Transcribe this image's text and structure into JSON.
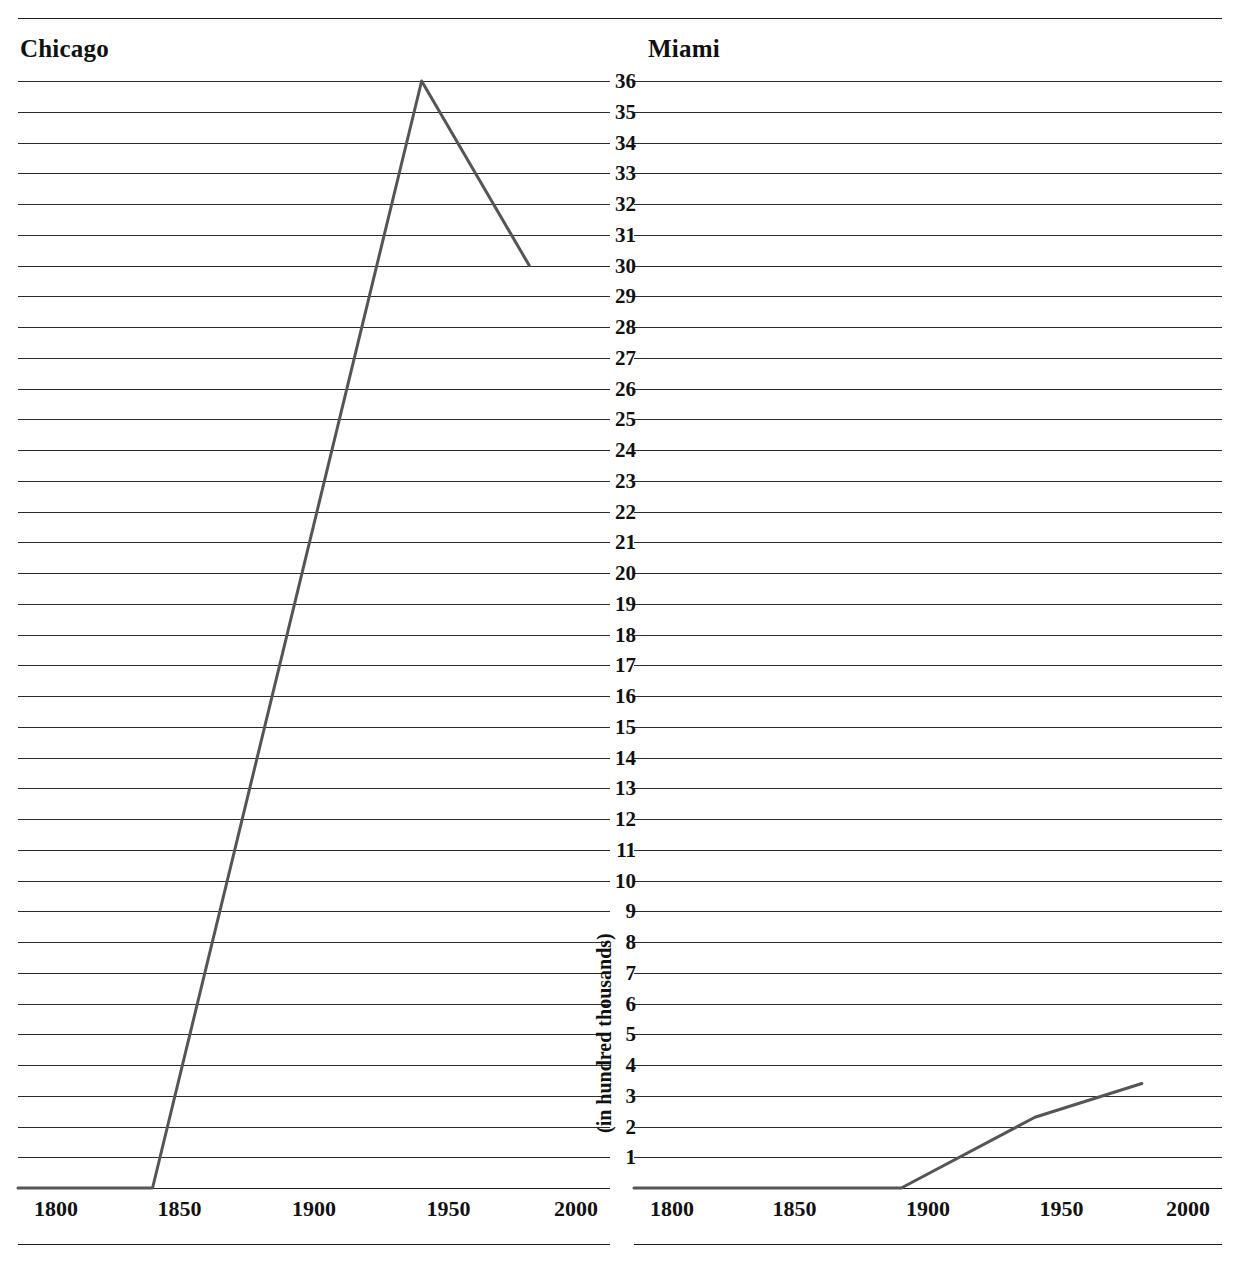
{
  "figure": {
    "yaxis_caption": "(in hundred thousands)"
  },
  "panels": [
    {
      "key": "chicago",
      "title": "Chicago"
    },
    {
      "key": "miami",
      "title": "Miami"
    }
  ],
  "axis": {
    "y_ticks": [
      36,
      35,
      34,
      33,
      32,
      31,
      30,
      29,
      28,
      27,
      26,
      25,
      24,
      23,
      22,
      21,
      20,
      19,
      18,
      17,
      16,
      15,
      14,
      13,
      12,
      11,
      10,
      9,
      8,
      7,
      6,
      5,
      4,
      3,
      2,
      1
    ],
    "x_ticks": [
      1800,
      1850,
      1900,
      1950,
      2000
    ]
  },
  "chart_data": [
    {
      "type": "line",
      "title": "Chicago",
      "xlabel": "",
      "ylabel": "(in hundred thousands)",
      "xlim": [
        1790,
        2010
      ],
      "ylim": [
        0,
        36
      ],
      "xticks": [
        1800,
        1850,
        1900,
        1950,
        2000
      ],
      "yticks": [
        1,
        2,
        3,
        4,
        5,
        6,
        7,
        8,
        9,
        10,
        11,
        12,
        13,
        14,
        15,
        16,
        17,
        18,
        19,
        20,
        21,
        22,
        23,
        24,
        25,
        26,
        27,
        28,
        29,
        30,
        31,
        32,
        33,
        34,
        35,
        36
      ],
      "grid": "horizontal",
      "legend": "none",
      "x": [
        1790,
        1840,
        1940,
        1980
      ],
      "values": [
        0,
        0,
        36,
        30
      ],
      "line_color": "#555555"
    },
    {
      "type": "line",
      "title": "Miami",
      "xlabel": "",
      "ylabel": "(in hundred thousands)",
      "xlim": [
        1790,
        2010
      ],
      "ylim": [
        0,
        36
      ],
      "xticks": [
        1800,
        1850,
        1900,
        1950,
        2000
      ],
      "yticks": [
        1,
        2,
        3,
        4,
        5,
        6,
        7,
        8,
        9,
        10,
        11,
        12,
        13,
        14,
        15,
        16,
        17,
        18,
        19,
        20,
        21,
        22,
        23,
        24,
        25,
        26,
        27,
        28,
        29,
        30,
        31,
        32,
        33,
        34,
        35,
        36
      ],
      "grid": "horizontal",
      "legend": "none",
      "x": [
        1790,
        1890,
        1940,
        1980
      ],
      "values": [
        0,
        0,
        2.3,
        3.4
      ],
      "line_color": "#555555"
    }
  ]
}
